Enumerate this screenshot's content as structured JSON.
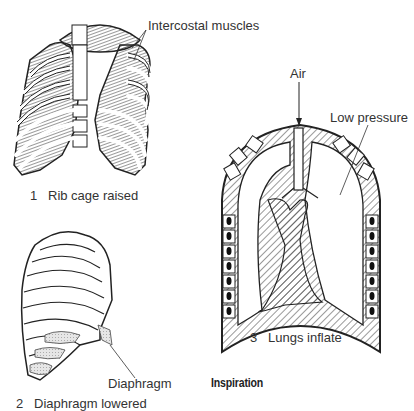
{
  "figure": {
    "title": "Inspiration",
    "panels": [
      {
        "number": "1",
        "caption": "Rib cage raised",
        "label": "Intercostal muscles"
      },
      {
        "number": "2",
        "caption": "Diaphragm lowered",
        "label": "Diaphragm"
      },
      {
        "number": "3",
        "caption": "Lungs inflate",
        "labels": [
          "Air",
          "Low pressure"
        ]
      }
    ]
  }
}
